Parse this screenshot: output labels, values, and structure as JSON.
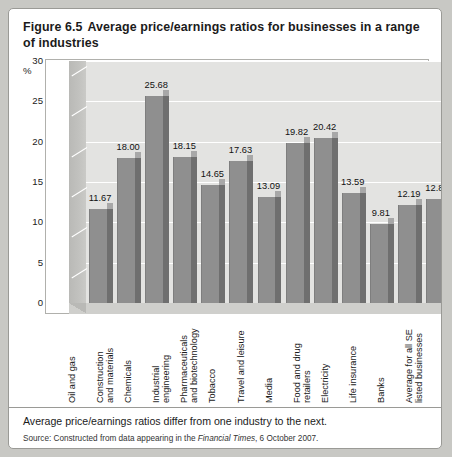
{
  "figure": {
    "number": "Figure 6.5",
    "title": "Average price/earnings ratios for businesses in a range of industries",
    "caption": "Average price/earnings ratios differ from one industry to the next.",
    "source_prefix": "Source: Constructed from data appearing in the ",
    "source_italic": "Financial Times",
    "source_suffix": ", 6 October 2007."
  },
  "chart_data": {
    "type": "bar",
    "title": "Average price/earnings ratios for businesses in a range of industries",
    "xlabel": "",
    "ylabel": "%",
    "ylim": [
      0,
      30
    ],
    "yticks": [
      0,
      5,
      10,
      15,
      20,
      25,
      30
    ],
    "ytick_labels": [
      "0",
      "5",
      "10",
      "15",
      "20",
      "25",
      "30"
    ],
    "grid": true,
    "legend": false,
    "categories": [
      "Oil and gas",
      "Construction and materials",
      "Chemicals",
      "Industrial engineering",
      "Pharmaceuticals and biotechnology",
      "Tobacco",
      "Travel and leisure",
      "Media",
      "Food and drug retailers",
      "Electricity",
      "Life insurance",
      "Banks",
      "Average for all SE listed businesses"
    ],
    "category_lines": [
      "Oil and gas",
      "Construction\nand materials",
      "Chemicals",
      "Industrial\nengineering",
      "Pharmaceuticals\nand biotechnology",
      "Tobacco",
      "Travel and leisure",
      "Media",
      "Food and drug\nretailers",
      "Electricity",
      "Life insurance",
      "Banks",
      "Average for all SE\nlisted businesses"
    ],
    "values": [
      11.67,
      18.0,
      25.68,
      18.15,
      14.65,
      17.63,
      13.09,
      19.82,
      20.42,
      13.59,
      9.81,
      12.19,
      12.87
    ],
    "value_labels": [
      "11.67",
      "18.00",
      "25.68",
      "18.15",
      "14.65",
      "17.63",
      "13.09",
      "19.82",
      "20.42",
      "13.59",
      "9.81",
      "12.19",
      "12.87"
    ],
    "colors": {
      "bar_front": "#8f8f8f",
      "bar_side": "#6f6f6f",
      "bar_top": "#a8a8a8",
      "plot_background": "#e3e3e1",
      "gridline": "#ffffff",
      "wall": "#b9b9b6",
      "figure_border": "#9a9a96"
    }
  }
}
